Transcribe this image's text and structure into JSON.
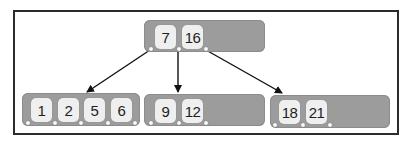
{
  "diagram": {
    "type": "B-tree",
    "root": {
      "keys": [
        "7",
        "16"
      ]
    },
    "children": [
      {
        "keys": [
          "1",
          "2",
          "5",
          "6"
        ]
      },
      {
        "keys": [
          "9",
          "12"
        ]
      },
      {
        "keys": [
          "18",
          "21"
        ]
      }
    ],
    "edges": [
      {
        "from": "root.pointer0",
        "to": "children.0"
      },
      {
        "from": "root.pointer1",
        "to": "children.1"
      },
      {
        "from": "root.pointer2",
        "to": "children.2"
      }
    ],
    "colors": {
      "node_fill": "#9c9c9c",
      "key_cell_fill": "#efefef",
      "text": "#1e1e1e",
      "arrow": "#111111",
      "frame_border": "#2b2b2b"
    }
  }
}
